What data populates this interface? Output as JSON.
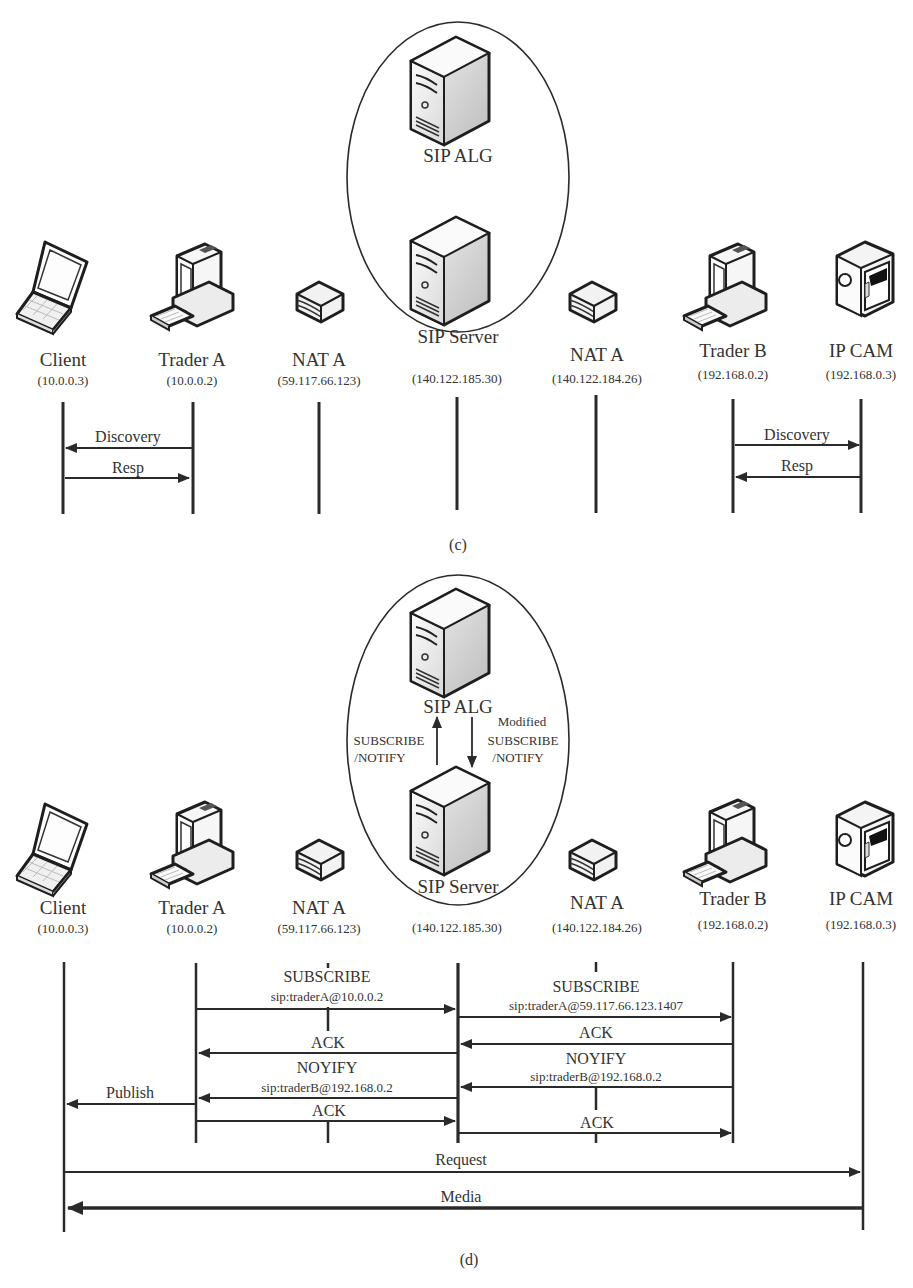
{
  "panels": [
    {
      "id": "c",
      "caption": "(c)",
      "cluster": {
        "top_node": {
          "label": "SIP ALG",
          "icon": "server-icon"
        },
        "bottom_node": {
          "label": "SIP Server",
          "icon": "server-icon"
        },
        "inner_arrows": []
      },
      "nodes": [
        {
          "name": "Client",
          "ip": "(10.0.0.3)",
          "icon": "laptop-icon"
        },
        {
          "name": "Trader A",
          "ip": "(10.0.0.2)",
          "icon": "desktop-pc-icon"
        },
        {
          "name": "NAT A",
          "ip": "(59.117.66.123)",
          "icon": "router-icon"
        },
        {
          "name": "",
          "ip": "(140.122.185.30)",
          "icon": ""
        },
        {
          "name": "NAT A",
          "ip": "(140.122.184.26)",
          "icon": "router-icon"
        },
        {
          "name": "Trader B",
          "ip": "(192.168.0.2)",
          "icon": "desktop-pc-icon"
        },
        {
          "name": "IP CAM",
          "ip": "(192.168.0.3)",
          "icon": "ip-camera-icon"
        }
      ],
      "messages": [
        {
          "label": "Discovery",
          "from": "Trader A",
          "to": "Client"
        },
        {
          "label": "Resp",
          "from": "Client",
          "to": "Trader A"
        },
        {
          "label": "Discovery",
          "from": "Trader B",
          "to": "IP CAM"
        },
        {
          "label": "Resp",
          "from": "IP CAM",
          "to": "Trader B"
        }
      ]
    },
    {
      "id": "d",
      "caption": "(d)",
      "cluster": {
        "top_node": {
          "label": "SIP  ALG",
          "icon": "server-icon"
        },
        "bottom_node": {
          "label": "SIP Server",
          "icon": "server-icon"
        },
        "inner_arrows": [
          {
            "label_line1": "SUBSCRIBE",
            "label_line2": "/NOTIFY",
            "direction": "up"
          },
          {
            "label_line0": "Modified",
            "label_line1": "SUBSCRIBE",
            "label_line2": "/NOTIFY",
            "direction": "down"
          }
        ]
      },
      "nodes": [
        {
          "name": "Client",
          "ip": "(10.0.0.3)",
          "icon": "laptop-icon"
        },
        {
          "name": "Trader A",
          "ip": "(10.0.0.2)",
          "icon": "desktop-pc-icon"
        },
        {
          "name": "NAT A",
          "ip": "(59.117.66.123)",
          "icon": "router-icon"
        },
        {
          "name": "",
          "ip": "(140.122.185.30)",
          "icon": ""
        },
        {
          "name": "NAT A",
          "ip": "(140.122.184.26)",
          "icon": "router-icon"
        },
        {
          "name": "Trader B",
          "ip": "(192.168.0.2)",
          "icon": "desktop-pc-icon"
        },
        {
          "name": "IP CAM",
          "ip": "(192.168.0.3)",
          "icon": "ip-camera-icon"
        }
      ],
      "messages": [
        {
          "label": "SUBSCRIBE",
          "sublabel": "sip:traderA@10.0.0.2",
          "from": "Trader A",
          "to": "SIP Server"
        },
        {
          "label": "SUBSCRIBE",
          "sublabel": "sip:traderA@59.117.66.123.1407",
          "from": "SIP Server",
          "to": "Trader B"
        },
        {
          "label": "ACK",
          "from": "SIP Server",
          "to": "Trader A"
        },
        {
          "label": "ACK",
          "from": "Trader B",
          "to": "SIP Server"
        },
        {
          "label": "NOYIFY",
          "sublabel": "sip:traderB@192.168.0.2",
          "from": "Trader B",
          "to": "SIP Server"
        },
        {
          "label": "NOYIFY",
          "sublabel": "sip:traderB@192.168.0.2",
          "from": "SIP Server",
          "to": "Trader A"
        },
        {
          "label": "Publish",
          "from": "Trader A",
          "to": "Client"
        },
        {
          "label": "ACK",
          "from": "Trader A",
          "to": "SIP Server"
        },
        {
          "label": "ACK",
          "from": "SIP Server",
          "to": "Trader B"
        },
        {
          "label": "Request",
          "from": "Client",
          "to": "IP CAM"
        },
        {
          "label": "Media",
          "from": "IP CAM",
          "to": "Client"
        }
      ]
    }
  ],
  "colors": {
    "line": "#2a2a2a",
    "text": "#333333",
    "background": "#ffffff"
  }
}
